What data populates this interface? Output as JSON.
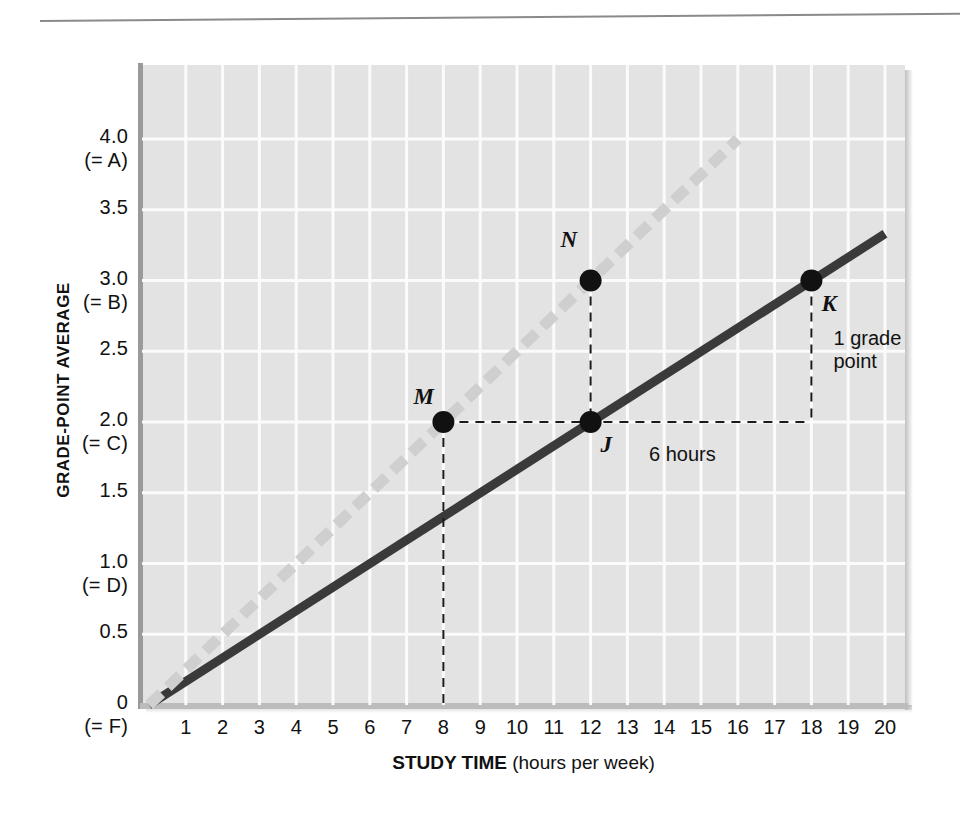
{
  "chart_data": {
    "type": "line",
    "title": "",
    "xlabel": "STUDY TIME (hours per week)",
    "ylabel": "GRADE-POINT AVERAGE",
    "xlim": [
      0,
      20
    ],
    "ylim": [
      0,
      4.2
    ],
    "grid": true,
    "legend": "none",
    "x_ticks": [
      1,
      2,
      3,
      4,
      5,
      6,
      7,
      8,
      9,
      10,
      11,
      12,
      13,
      14,
      15,
      16,
      17,
      18,
      19,
      20
    ],
    "y_ticks": [
      {
        "value": 0,
        "label": "0",
        "sub": "(= F)"
      },
      {
        "value": 0.5,
        "label": "0.5",
        "sub": ""
      },
      {
        "value": 1.0,
        "label": "1.0",
        "sub": "(= D)"
      },
      {
        "value": 1.5,
        "label": "1.5",
        "sub": ""
      },
      {
        "value": 2.0,
        "label": "2.0",
        "sub": "(= C)"
      },
      {
        "value": 2.5,
        "label": "2.5",
        "sub": ""
      },
      {
        "value": 3.0,
        "label": "3.0",
        "sub": "(= B)"
      },
      {
        "value": 3.5,
        "label": "3.5",
        "sub": ""
      },
      {
        "value": 4.0,
        "label": "4.0",
        "sub": "(= A)"
      }
    ],
    "series": [
      {
        "name": "solid-line",
        "style": "solid",
        "color": "#3a3a3a",
        "x": [
          0,
          20
        ],
        "y": [
          0,
          3.33
        ]
      },
      {
        "name": "dashed-line",
        "style": "dashed",
        "color": "#cfcfcf",
        "x": [
          0,
          16
        ],
        "y": [
          0,
          4.0
        ]
      }
    ],
    "points": [
      {
        "label": "M",
        "x": 8,
        "y": 2.0,
        "series": "dashed-line"
      },
      {
        "label": "N",
        "x": 12,
        "y": 3.0,
        "series": "dashed-line"
      },
      {
        "label": "J",
        "x": 12,
        "y": 2.0,
        "series": "solid-line"
      },
      {
        "label": "K",
        "x": 18,
        "y": 3.0,
        "series": "solid-line"
      }
    ],
    "annotations": [
      {
        "name": "rise-label",
        "text": "1 grade\npoint",
        "line1": "1 grade",
        "line2": "point",
        "x": 18.6,
        "y": 2.5
      },
      {
        "name": "run-label",
        "text": "6 hours",
        "x": 15,
        "y": 1.85
      }
    ],
    "guides": [
      {
        "name": "m-drop-line",
        "from": [
          8,
          2.0
        ],
        "to": [
          8,
          0
        ]
      },
      {
        "name": "m-to-j-line",
        "from": [
          8,
          2.0
        ],
        "to": [
          18,
          2.0
        ]
      },
      {
        "name": "n-to-j-line",
        "from": [
          12,
          3.0
        ],
        "to": [
          12,
          2.0
        ]
      },
      {
        "name": "k-drop-line",
        "from": [
          18,
          3.0
        ],
        "to": [
          18,
          2.0
        ]
      }
    ],
    "colors": {
      "plot_background": "#e3e3e3",
      "gridline": "#fbfbfb",
      "solid_series": "#3a3a3a",
      "dashed_series": "#cfcfcf",
      "text": "#111111"
    }
  },
  "figure": {
    "has_top_rule": true
  }
}
